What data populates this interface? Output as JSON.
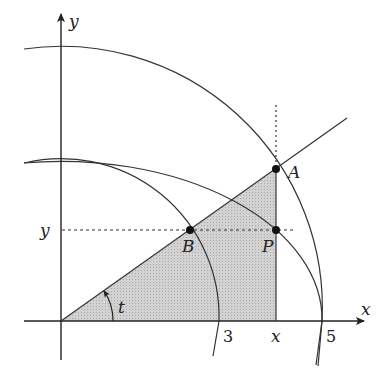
{
  "figure": {
    "axes": {
      "x_label": "x",
      "y_label": "y"
    },
    "tick_labels": {
      "three": "3",
      "x": "x",
      "five": "5",
      "y": "y"
    },
    "points": {
      "A": "A",
      "B": "B",
      "P": "P"
    },
    "angle_label": "t",
    "radii": {
      "inner": 3,
      "outer": 5
    },
    "colors": {
      "shade": "#cfcfcf",
      "stroke": "#333333"
    }
  }
}
